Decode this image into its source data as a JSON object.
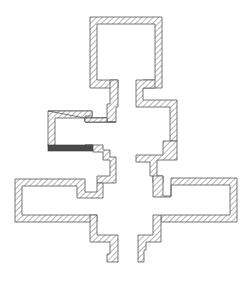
{
  "diagram": {
    "type": "architectural floor-plan section (hatched walls)",
    "colors": {
      "background": "#ffffff",
      "hatch_line": "#6a6a6a",
      "outline": "#555555",
      "solid_bar": "#4a4a4a"
    },
    "hatch": {
      "angle_deg": 45,
      "spacing_px": 4
    },
    "components": [
      {
        "id": "top-chamber",
        "label": ""
      },
      {
        "id": "left-neck-wall",
        "label": ""
      },
      {
        "id": "right-neck-wall",
        "label": ""
      },
      {
        "id": "left-small-room",
        "label": ""
      },
      {
        "id": "left-wing",
        "label": ""
      },
      {
        "id": "right-wing",
        "label": ""
      },
      {
        "id": "left-lower-leg",
        "label": ""
      },
      {
        "id": "right-lower-leg",
        "label": ""
      },
      {
        "id": "solid-bar",
        "label": ""
      }
    ]
  }
}
